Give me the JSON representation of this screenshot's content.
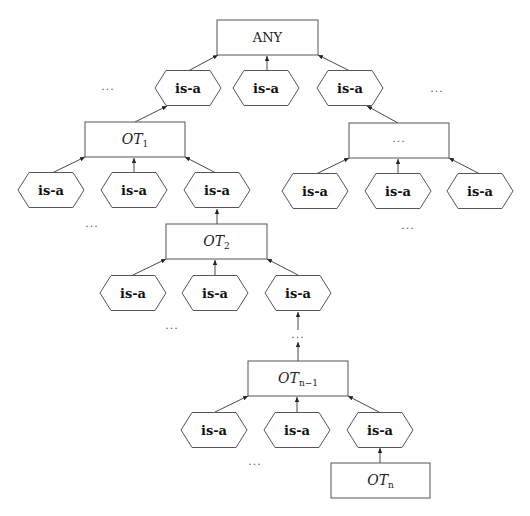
{
  "diagram": {
    "root": {
      "label": "ANY"
    },
    "relation_label": "is-a",
    "ellipsis": "...",
    "types": [
      {
        "id": "any",
        "base": "ANY",
        "sub": ""
      },
      {
        "id": "ot1",
        "base": "OT",
        "sub": "1"
      },
      {
        "id": "other",
        "base": "...",
        "sub": ""
      },
      {
        "id": "ot2",
        "base": "OT",
        "sub": "2"
      },
      {
        "id": "otn1",
        "base": "OT",
        "sub": "n−1"
      },
      {
        "id": "otn",
        "base": "OT",
        "sub": "n"
      }
    ],
    "edges": [
      {
        "from": "isa-any-1",
        "to": "any"
      },
      {
        "from": "isa-any-2",
        "to": "any"
      },
      {
        "from": "isa-any-3",
        "to": "any"
      },
      {
        "from": "ot1",
        "to": "isa-any-1"
      },
      {
        "from": "other",
        "to": "isa-any-3"
      },
      {
        "from": "isa-ot1-1",
        "to": "ot1"
      },
      {
        "from": "isa-ot1-2",
        "to": "ot1"
      },
      {
        "from": "isa-ot1-3",
        "to": "ot1"
      },
      {
        "from": "isa-other-1",
        "to": "other"
      },
      {
        "from": "isa-other-2",
        "to": "other"
      },
      {
        "from": "isa-other-3",
        "to": "other"
      },
      {
        "from": "ot2",
        "to": "isa-ot1-3"
      },
      {
        "from": "isa-ot2-1",
        "to": "ot2"
      },
      {
        "from": "isa-ot2-2",
        "to": "ot2"
      },
      {
        "from": "isa-ot2-3",
        "to": "ot2"
      },
      {
        "from": "otn1",
        "to": "isa-ot2-3",
        "via": "..."
      },
      {
        "from": "isa-otn1-1",
        "to": "otn1"
      },
      {
        "from": "isa-otn1-2",
        "to": "otn1"
      },
      {
        "from": "isa-otn1-3",
        "to": "otn1"
      },
      {
        "from": "otn",
        "to": "isa-otn1-3"
      }
    ]
  }
}
